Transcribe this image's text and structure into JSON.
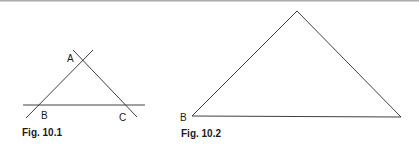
{
  "figures": [
    {
      "caption": "Fig. 10.1",
      "labels": {
        "a": "A",
        "b": "B",
        "c": "C"
      }
    },
    {
      "caption": "Fig. 10.2",
      "labels": {
        "b": "B"
      }
    }
  ],
  "colors": {
    "stroke": "#2a2a2a",
    "text": "#1a1a1a",
    "background": "#ffffff"
  }
}
